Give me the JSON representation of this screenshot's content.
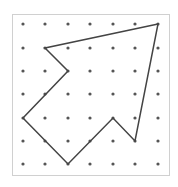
{
  "diagram": {
    "type": "dot-grid-polygon",
    "grid": {
      "columns": 7,
      "rows": 7,
      "x_positions": [
        23,
        45,
        68,
        90,
        113,
        135,
        158
      ],
      "y_positions": [
        24,
        48,
        71,
        94,
        118,
        141,
        164
      ]
    },
    "frame": {
      "x": 12,
      "y": 14,
      "width": 157,
      "height": 161
    },
    "polygon": {
      "vertices_grid": [
        [
          6,
          0
        ],
        [
          1,
          1
        ],
        [
          2,
          2
        ],
        [
          0,
          4
        ],
        [
          2,
          6
        ],
        [
          4,
          4
        ],
        [
          5,
          5
        ]
      ]
    },
    "colors": {
      "background": "#ffffff",
      "frame": "#d0d0d0",
      "dot": "#555555",
      "line": "#444444"
    }
  }
}
